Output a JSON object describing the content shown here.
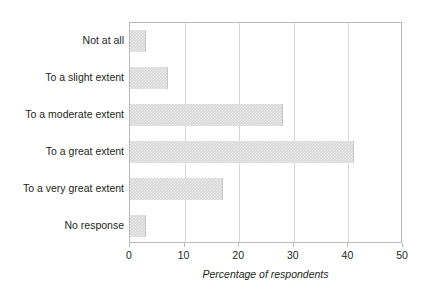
{
  "chart_data": {
    "type": "bar",
    "orientation": "horizontal",
    "title": "",
    "xlabel": "Percentage of respondents",
    "ylabel": "",
    "categories": [
      "Not at all",
      "To a slight extent",
      "To a moderate extent",
      "To a great extent",
      "To a very great extent",
      "No response"
    ],
    "values": [
      3,
      7,
      28,
      41,
      17,
      3
    ],
    "xlim": [
      0,
      50
    ],
    "xticks": [
      0,
      10,
      20,
      30,
      40,
      50
    ],
    "xtick_labels": [
      "0",
      "10",
      "20",
      "30",
      "40",
      "50"
    ],
    "grid": "vertical-gridlines-at-xticks",
    "legend": "none",
    "bar_color": "#d6d6d6",
    "bar_edge_color": "#c4c4c4",
    "axis_color": "#b9b9b9",
    "text_color": "#231f20",
    "background": "#ffffff"
  }
}
